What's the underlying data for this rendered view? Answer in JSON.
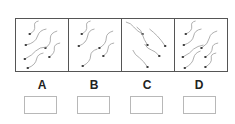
{
  "figure": {
    "panels": [
      {
        "id": "A",
        "label": "A",
        "direction": "heads-lower-left, tails-upper-right",
        "cells": [
          {
            "hx": 14,
            "hy": 15,
            "tail": "M14 15 Q20 12 19 7 Q18 3 23 2"
          },
          {
            "hx": 10,
            "hy": 26,
            "tail": "M10 26 Q20 24 22 17 Q24 11 31 10"
          },
          {
            "hx": 30,
            "hy": 29,
            "tail": "M30 29 Q36 25 35 19 Q35 14 42 12"
          },
          {
            "hx": 34,
            "hy": 38,
            "tail": "M34 38 Q40 34 39 29 Q39 25 45 24"
          },
          {
            "hx": 9,
            "hy": 40,
            "tail": "M9 40 Q17 36 20 32 Q24 28 31 28"
          },
          {
            "hx": 12,
            "hy": 49,
            "tail": "M12 49 Q20 46 21 40 Q22 35 28 34"
          }
        ]
      },
      {
        "id": "B",
        "label": "B",
        "direction": "heads-lower-left, tails-upper-right",
        "cells": [
          {
            "hx": 13,
            "hy": 15,
            "tail": "M13 15 Q19 12 18 7 Q17 3 22 2"
          },
          {
            "hx": 10,
            "hy": 27,
            "tail": "M10 27 Q18 24 19 17 Q20 11 26 10"
          },
          {
            "hx": 31,
            "hy": 29,
            "tail": "M31 29 Q38 25 38 19 Q38 14 45 12"
          },
          {
            "hx": 35,
            "hy": 37,
            "tail": "M35 37 Q40 34 40 29 Q40 25 46 24"
          },
          {
            "hx": 14,
            "hy": 47,
            "tail": "M14 47 Q22 43 22 37 Q22 32 29 30"
          }
        ]
      },
      {
        "id": "C",
        "label": "C",
        "direction": "heads-lower-right, tails-upper-left",
        "cells": [
          {
            "hx": 21,
            "hy": 15,
            "tail": "M21 15 Q15 12 12 8 Q9 4 4 3"
          },
          {
            "hx": 26,
            "hy": 26,
            "tail": "M26 26 Q22 20 21 16 Q20 11 15 8"
          },
          {
            "hx": 44,
            "hy": 27,
            "tail": "M44 27 Q40 21 36 17 Q32 13 28 10"
          },
          {
            "hx": 38,
            "hy": 37,
            "tail": "M38 37 Q34 32 30 31 Q26 30 23 25"
          },
          {
            "hx": 26,
            "hy": 48,
            "tail": "M26 48 Q22 42 18 39 Q13 36 11 31"
          }
        ]
      },
      {
        "id": "D",
        "label": "D",
        "direction": "heads-lower-left, tails-upper-right",
        "cells": [
          {
            "hx": 11,
            "hy": 15,
            "tail": "M11 15 Q18 12 17 7 Q16 3 21 2"
          },
          {
            "hx": 9,
            "hy": 26,
            "tail": "M9 26 Q18 23 19 17 Q20 11 27 10"
          },
          {
            "hx": 27,
            "hy": 29,
            "tail": "M27 29 Q34 25 35 19 Q36 14 43 12"
          },
          {
            "hx": 8,
            "hy": 38,
            "tail": "M8 38 Q16 34 19 30 Q23 27 29 26"
          },
          {
            "hx": 31,
            "hy": 38,
            "tail": "M31 38 Q38 34 38 29 Q38 25 44 24"
          },
          {
            "hx": 10,
            "hy": 49,
            "tail": "M10 49 Q18 45 19 39 Q20 34 26 32"
          },
          {
            "hx": 31,
            "hy": 48,
            "tail": "M31 48 Q38 44 37 39 Q36 35 42 34"
          }
        ]
      }
    ],
    "answer_boxes": [
      {
        "for": "A",
        "value": ""
      },
      {
        "for": "B",
        "value": ""
      },
      {
        "for": "C",
        "value": ""
      },
      {
        "for": "D",
        "value": ""
      }
    ],
    "colors": {
      "border": "#555555",
      "tail": "#9a9a9a",
      "head": "#333333",
      "box_border": "#b8b8b8"
    }
  }
}
